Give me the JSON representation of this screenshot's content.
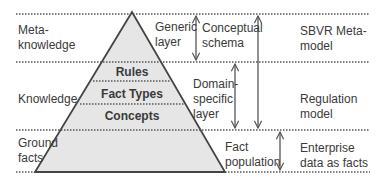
{
  "rows": [
    {
      "left_label": "Meta-\nknowledge",
      "right_label": "SBVR Meta-\nmodel"
    },
    {
      "left_label": "Knowledge",
      "right_label": "Regulation\nmodel"
    },
    {
      "left_label": "Ground\nfacts",
      "right_label": "Enterprise\ndata as facts"
    }
  ],
  "pyramid": {
    "layers": [
      "Rules",
      "Fact Types",
      "Concepts"
    ],
    "fill": "#e6e6e6",
    "stroke": "#444444"
  },
  "layer_labels": {
    "generic": "Generic\nlayer",
    "domain_specific": "Domain-\nspecific\nlayer",
    "conceptual_schema": "Conceptual\nschema",
    "fact_population": "Fact\npopulation"
  },
  "colors": {
    "dotted_line": "#555555",
    "text": "#3a3a3a",
    "arrow": "#555555"
  }
}
